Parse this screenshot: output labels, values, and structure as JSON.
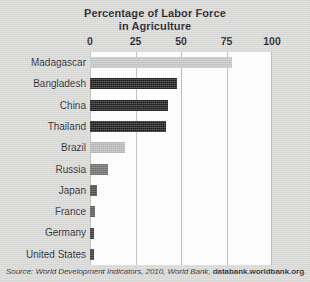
{
  "figure": {
    "title_line1": "Percentage of Labor Force",
    "title_line2": "in Agriculture",
    "background_color": "#d9d9d8",
    "plot_background_color": "#ffffff",
    "gridline_color": "#b9b9b9"
  },
  "source_note": {
    "prefix": "Source: World Development Indicators, 2010, World Bank, ",
    "link": "databank.worldbank.org",
    "suffix": "."
  },
  "chart_data": {
    "type": "bar",
    "orientation": "horizontal",
    "title": "Percentage of Labor Force in Agriculture",
    "xlabel": "",
    "ylabel": "",
    "xlim": [
      0,
      100
    ],
    "xticks": [
      0,
      25,
      50,
      75,
      100
    ],
    "xtick_labels": [
      "0",
      "25",
      "50",
      "75",
      "100"
    ],
    "grid": true,
    "legend": "none",
    "categories": [
      "Madagascar",
      "Bangladesh",
      "China",
      "Thailand",
      "Brazil",
      "Russia",
      "Japan",
      "France",
      "Germany",
      "United States"
    ],
    "values": [
      78,
      48,
      43,
      42,
      19,
      10,
      4,
      3,
      2,
      2
    ],
    "bar_colors": [
      "#c6c6c6",
      "#1c1c1c",
      "#1c1c1c",
      "#1c1c1c",
      "#b9b9b9",
      "#6e6e6e",
      "#4a4a4a",
      "#5a5a5a",
      "#3a3a3a",
      "#3a3a3a"
    ]
  }
}
